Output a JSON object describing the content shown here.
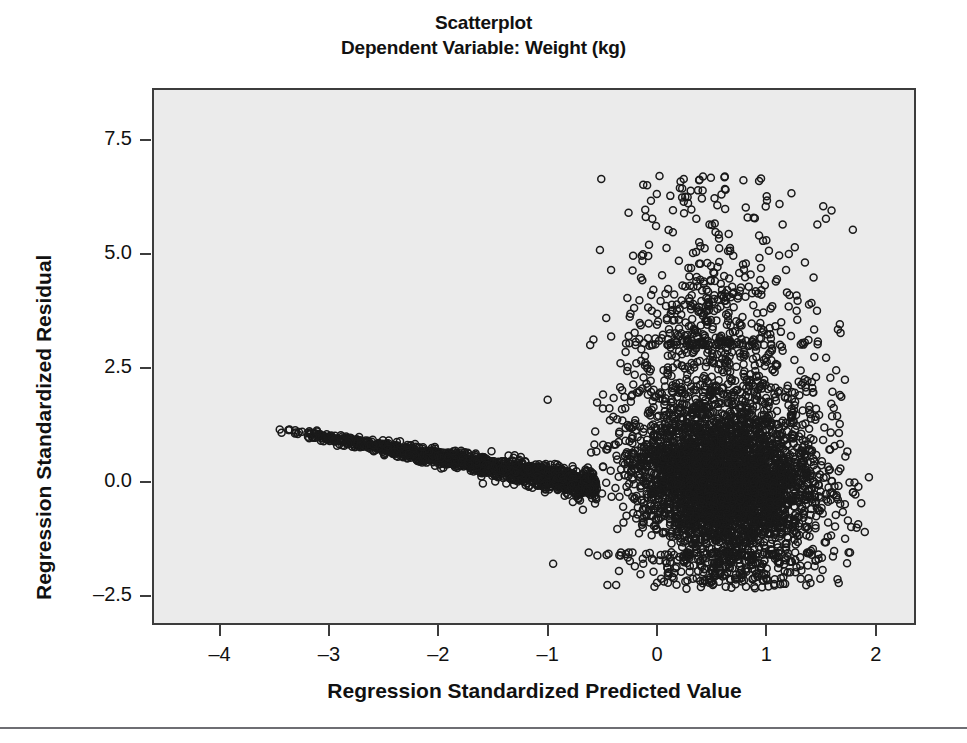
{
  "figure": {
    "title": "Scatterplot",
    "subtitle": "Dependent Variable: Weight (kg)",
    "background_color": "#ffffff",
    "plot_background_color": "#ebebeb",
    "frame_color": "#3c3c3c",
    "marker_color": "#1a1a1a"
  },
  "chart_data": {
    "type": "scatter",
    "title": "Scatterplot",
    "subtitle": "Dependent Variable: Weight (kg)",
    "xlabel": "Regression Standardized Predicted Value",
    "ylabel": "Regression Standardized Residual",
    "xlim": [
      -4.6,
      2.35
    ],
    "ylim": [
      -3.1,
      8.6
    ],
    "xticks": [
      -4,
      -3,
      -2,
      -1,
      0,
      1,
      2
    ],
    "xtick_labels": [
      "–4",
      "–3",
      "–2",
      "–1",
      "0",
      "1",
      "2"
    ],
    "yticks": [
      -2.5,
      0.0,
      2.5,
      5.0,
      7.5
    ],
    "ytick_labels": [
      "–2.5",
      "0.0",
      "2.5",
      "5.0",
      "7.5"
    ],
    "grid": false,
    "legend": "none",
    "marker": "open-circle",
    "marker_size_px": 7,
    "n_points_approx": 6000,
    "annotations": [],
    "clusters": [
      {
        "name": "left-tail-band",
        "x_range": [
          -3.45,
          -0.55
        ],
        "y_at_x_min": 1.15,
        "y_at_x_max": 0.0,
        "band_half_width": 0.22,
        "n_points": 1500
      },
      {
        "name": "main-cloud",
        "x_center": 0.62,
        "y_center": 0.05,
        "x_sigma": 0.42,
        "y_sigma": 0.78,
        "x_range": [
          -0.7,
          1.95
        ],
        "y_range": [
          -2.35,
          4.6
        ],
        "n_points": 4200
      },
      {
        "name": "upper-outliers",
        "x_range": [
          -1.1,
          1.85
        ],
        "y_range": [
          3.0,
          6.75
        ],
        "n_points": 300
      }
    ],
    "extreme_points": [
      {
        "x": 0.42,
        "y": 6.7
      },
      {
        "x": 0.62,
        "y": 6.7
      },
      {
        "x": 0.28,
        "y": 6.25
      },
      {
        "x": 1.12,
        "y": 6.1
      },
      {
        "x": 1.52,
        "y": 6.05
      },
      {
        "x": 0.48,
        "y": 5.65
      },
      {
        "x": 1.0,
        "y": 5.3
      },
      {
        "x": 1.26,
        "y": 5.15
      },
      {
        "x": -0.42,
        "y": 4.65
      },
      {
        "x": 0.2,
        "y": 4.85
      },
      {
        "x": 0.46,
        "y": 4.8
      },
      {
        "x": 1.18,
        "y": 4.65
      },
      {
        "x": -1.0,
        "y": 1.8
      },
      {
        "x": -0.95,
        "y": -1.8
      },
      {
        "x": 1.72,
        "y": -1.25
      },
      {
        "x": 1.9,
        "y": -1.1
      },
      {
        "x": -3.45,
        "y": 1.15
      }
    ]
  },
  "axes": {
    "x_axis_title": "Regression Standardized Predicted Value",
    "y_axis_title": "Regression Standardized Residual"
  }
}
